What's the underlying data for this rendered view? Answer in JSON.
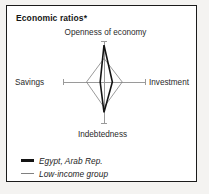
{
  "panel": {
    "title": "Economic ratios*"
  },
  "chart_data": {
    "type": "radar",
    "title": "Economic ratios*",
    "grid": false,
    "legend_position": "bottom-left",
    "axes": [
      {
        "key": "openness",
        "label": "Openness of economy",
        "position": "top"
      },
      {
        "key": "investment",
        "label": "Investment",
        "position": "right"
      },
      {
        "key": "indebtedness",
        "label": "Indebtedness",
        "position": "bottom"
      },
      {
        "key": "savings",
        "label": "Savings",
        "position": "left"
      }
    ],
    "categories": [
      "Openness of economy",
      "Investment",
      "Indebtedness",
      "Savings"
    ],
    "axis_max": 1.0,
    "series": [
      {
        "name": "Egypt, Arab Rep.",
        "color": "#141414",
        "line_width": 1.6,
        "values": [
          0.97,
          0.22,
          0.8,
          0.1
        ]
      },
      {
        "name": "Low-income group",
        "color": "#808080",
        "line_width": 0.8,
        "values": [
          0.62,
          0.48,
          0.66,
          0.46
        ]
      }
    ],
    "axis_color": "#9a9a9a"
  },
  "legend": {
    "items": [
      {
        "label": "Egypt, Arab Rep.",
        "style": "thick",
        "swatch_name": "legend-swatch-egypt"
      },
      {
        "label": "Low-income group",
        "style": "thin",
        "swatch_name": "legend-swatch-low-income"
      }
    ]
  }
}
